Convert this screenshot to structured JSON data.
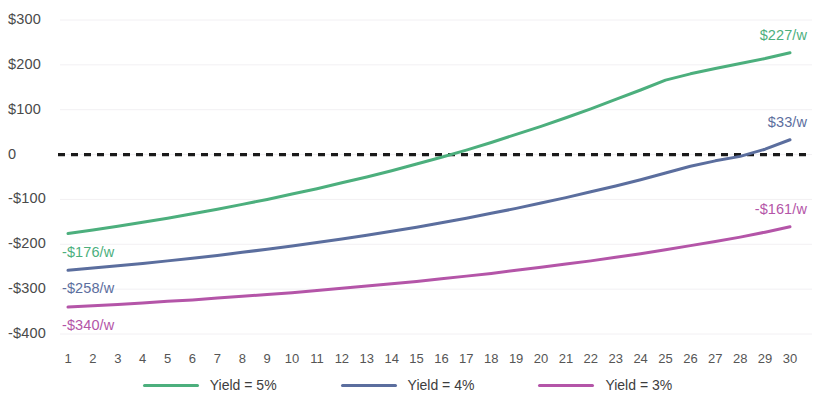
{
  "chart_data": {
    "type": "line",
    "title": "",
    "subtitle": "",
    "xlabel": "",
    "ylabel": "",
    "xlim": [
      1,
      30
    ],
    "ylim": [
      -400,
      300
    ],
    "grid": true,
    "legend_position": "bottom",
    "zero_line": {
      "value": 0,
      "style": "dashed",
      "color": "#1a1a1a"
    },
    "x": [
      1,
      2,
      3,
      4,
      5,
      6,
      7,
      8,
      9,
      10,
      11,
      12,
      13,
      14,
      15,
      16,
      17,
      18,
      19,
      20,
      21,
      22,
      23,
      24,
      25,
      26,
      27,
      28,
      29,
      30
    ],
    "xtick_labels": [
      "1",
      "2",
      "3",
      "4",
      "5",
      "6",
      "7",
      "8",
      "9",
      "10",
      "11",
      "12",
      "13",
      "14",
      "15",
      "16",
      "17",
      "18",
      "19",
      "20",
      "21",
      "22",
      "23",
      "24",
      "25",
      "26",
      "27",
      "28",
      "29",
      "30"
    ],
    "ytick_values": [
      300,
      200,
      100,
      0,
      -100,
      -200,
      -300,
      -400
    ],
    "ytick_labels": [
      "$300",
      "$200",
      "$100",
      "0",
      "-$100",
      "-$200",
      "-$300",
      "-$400"
    ],
    "series": [
      {
        "name": "Yield = 5%",
        "legend_label": "Yield = 5%",
        "color": "#4CAF7D",
        "label_color": "#4CAF7D",
        "start_label": "-$176/w",
        "end_label": "$227/w",
        "start_value": -176,
        "end_value": 227,
        "values": [
          -176,
          -168,
          -160,
          -151,
          -142,
          -132,
          -122,
          -111,
          -100,
          -88,
          -76,
          -63,
          -50,
          -36,
          -21,
          -6,
          10,
          27,
          45,
          63,
          82,
          102,
          123,
          144,
          166,
          180,
          192,
          203,
          214,
          227
        ]
      },
      {
        "name": "Yield = 4%",
        "legend_label": "Yield = 4%",
        "color": "#5B6E9E",
        "label_color": "#5B6E9E",
        "start_label": "-$258/w",
        "end_label": "$33/w",
        "start_value": -258,
        "end_value": 33,
        "values": [
          -258,
          -253,
          -248,
          -243,
          -237,
          -231,
          -225,
          -218,
          -211,
          -204,
          -196,
          -188,
          -180,
          -171,
          -162,
          -152,
          -142,
          -131,
          -120,
          -108,
          -96,
          -83,
          -70,
          -56,
          -41,
          -26,
          -14,
          -4,
          12,
          33
        ]
      },
      {
        "name": "Yield = 3%",
        "legend_label": "Yield = 3%",
        "color": "#B455A8",
        "label_color": "#B455A8",
        "start_label": "-$340/w",
        "end_label": "-$161/w",
        "start_value": -340,
        "end_value": -161,
        "values": [
          -340,
          -337,
          -334,
          -331,
          -327,
          -324,
          -320,
          -316,
          -312,
          -308,
          -303,
          -298,
          -293,
          -288,
          -283,
          -277,
          -271,
          -265,
          -258,
          -251,
          -244,
          -237,
          -229,
          -221,
          -212,
          -203,
          -194,
          -184,
          -173,
          -161
        ]
      }
    ]
  }
}
